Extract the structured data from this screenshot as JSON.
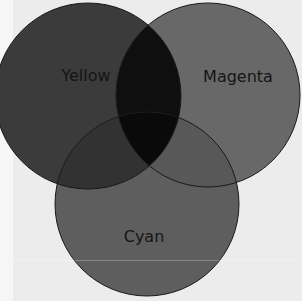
{
  "diagram": {
    "type": "venn",
    "sets": [
      {
        "id": "yellow",
        "label": "Yellow",
        "color": "#3b3b3b"
      },
      {
        "id": "magenta",
        "label": "Magenta",
        "color": "#686868"
      },
      {
        "id": "cyan",
        "label": "Cyan",
        "color": "#5e5e5e"
      }
    ],
    "overlaps": {
      "yellow_magenta": "#0f0f0f",
      "yellow_cyan": "#323232",
      "magenta_cyan": "#585858",
      "all": "#0a0a0a"
    },
    "outline_color": "#1a1a1a",
    "background": "#ececec"
  }
}
